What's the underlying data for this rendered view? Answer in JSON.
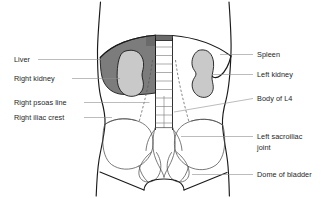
{
  "figure": {
    "background_color": "#ffffff",
    "labels_left": [
      {
        "id": "liver",
        "text": "Liver",
        "x": 14,
        "y": 62
      },
      {
        "id": "right-kidney",
        "text": "Right kidney",
        "x": 14,
        "y": 81
      },
      {
        "id": "right-psoas-line",
        "text": "Right psoas line",
        "x": 14,
        "y": 105
      },
      {
        "id": "right-iliac-crest",
        "text": "Right iliac crest",
        "x": 14,
        "y": 120
      }
    ],
    "labels_right": [
      {
        "id": "spleen",
        "text": "Spleen",
        "x": 257,
        "y": 57
      },
      {
        "id": "left-kidney",
        "text": "Left kidney",
        "x": 257,
        "y": 77
      },
      {
        "id": "body-of-l4",
        "text": "Body of L4",
        "x": 257,
        "y": 101
      },
      {
        "id": "left-sacroiliac-joint-line1",
        "text": "Left sacroiliac",
        "x": 257,
        "y": 139
      },
      {
        "id": "left-sacroiliac-joint-line2",
        "text": "joint",
        "x": 257,
        "y": 150
      },
      {
        "id": "dome-of-bladder",
        "text": "Dome of bladder",
        "x": 257,
        "y": 177
      }
    ],
    "colors": {
      "liver_fill": "#7c7c7c",
      "kidney_fill": "#c9c9c9",
      "outline_stroke": "#1a1a1a",
      "bone_stroke": "#4d4d4d",
      "leader_stroke": "#8f8f8f",
      "text_fill": "#262626"
    },
    "structures": [
      "body outline",
      "diaphragm",
      "liver",
      "spleen",
      "right kidney",
      "left kidney",
      "lumbar spine",
      "right psoas line",
      "left psoas line",
      "iliac crests",
      "sacrum",
      "sacroiliac joints",
      "pubic rami",
      "dome of bladder"
    ]
  }
}
